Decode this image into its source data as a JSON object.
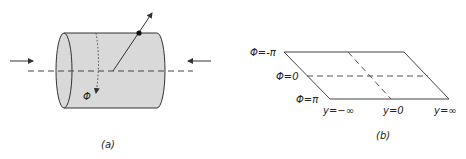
{
  "panel_a": {
    "caption": "(a)",
    "angle_label": "Φ",
    "colors": {
      "cylinder_fill": "#d9d9d9",
      "stroke": "#333333"
    }
  },
  "panel_b": {
    "caption": "(b)",
    "phi_labels": [
      "Φ=-π",
      "Φ=0",
      "Φ=π"
    ],
    "y_labels": [
      "y=−∞",
      "y=0",
      "y=∞"
    ]
  }
}
